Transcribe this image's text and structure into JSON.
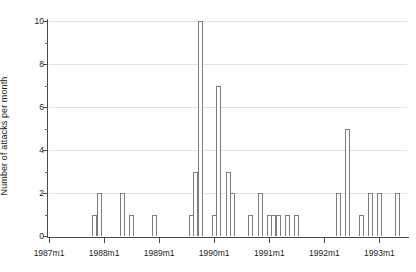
{
  "chart_data": {
    "type": "bar",
    "title": "",
    "subtitle": "",
    "xlabel": "",
    "ylabel": "Number of attacks per month",
    "ylim": [
      0,
      10
    ],
    "y_ticks": [
      0,
      2,
      4,
      6,
      8,
      10
    ],
    "y_tick_labels": [
      "0",
      "2",
      "4",
      "6",
      "8",
      "10"
    ],
    "y_minor_ticks": [
      1,
      3,
      5,
      7,
      9
    ],
    "grid": true,
    "grid_axis": "y",
    "legend": null,
    "x_tick_labels": [
      "1987m1",
      "1988m1",
      "1989m1",
      "1990m1",
      "1991m1",
      "1992m1",
      "1993m1"
    ],
    "x_tick_months": [
      0,
      12,
      24,
      36,
      48,
      60,
      72
    ],
    "x_range_months": [
      0,
      78
    ],
    "x_origin_label": "1987m1",
    "bar_color": "#fdfdfd",
    "bar_edge_color": "#7d7d7d",
    "grid_color": "#e2e2e2",
    "axis_color": "#4a4a4a",
    "categories": [
      "1987m11",
      "1987m12",
      "1988m5",
      "1988m7",
      "1988m12",
      "1989m8",
      "1989m9",
      "1989m10",
      "1990m1",
      "1990m2",
      "1990m4",
      "1990m5",
      "1990m9",
      "1990m11",
      "1991m1",
      "1991m2",
      "1991m3",
      "1991m5",
      "1991m7",
      "1992m4",
      "1992m6",
      "1992m9",
      "1992m11",
      "1993m1",
      "1993m5"
    ],
    "values": [
      1,
      2,
      2,
      1,
      1,
      1,
      3,
      10,
      1,
      7,
      3,
      2,
      1,
      2,
      1,
      1,
      1,
      1,
      1,
      2,
      5,
      1,
      2,
      2,
      2
    ],
    "month_indices": [
      10,
      11,
      16,
      18,
      23,
      31,
      32,
      33,
      36,
      37,
      39,
      40,
      44,
      46,
      48,
      49,
      50,
      52,
      54,
      63,
      65,
      68,
      70,
      72,
      76
    ],
    "max_value": 10,
    "max_value_category": "1989m10",
    "total_attacks": 56
  }
}
